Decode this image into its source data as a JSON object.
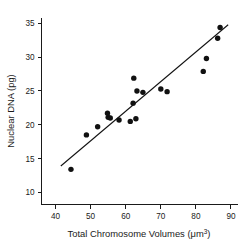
{
  "chart_data": {
    "type": "scatter",
    "title": "",
    "xlabel": "Total Chromosome Volumes (μm³)",
    "xlabel_base": "Total Chromosome Volumes (",
    "xlabel_mu": "μm",
    "xlabel_sup": "3",
    "xlabel_close": ")",
    "ylabel": "Nuclear DNA (pg)",
    "xlim": [
      36,
      92
    ],
    "ylim": [
      8.2,
      35.8
    ],
    "xticks": [
      40,
      50,
      60,
      70,
      80,
      90
    ],
    "xtick_labels": [
      "40",
      "50",
      "60",
      "70",
      "80",
      "90"
    ],
    "yticks": [
      10,
      15,
      20,
      25,
      30,
      35
    ],
    "ytick_labels": [
      "10",
      "15",
      "20",
      "25",
      "30",
      "35"
    ],
    "grid": false,
    "legend": "none",
    "marker": "filled-circle",
    "marker_color": "#111111",
    "points": [
      {
        "x": 44.4,
        "y": 13.4
      },
      {
        "x": 48.8,
        "y": 18.5
      },
      {
        "x": 52.0,
        "y": 19.7
      },
      {
        "x": 54.8,
        "y": 21.7
      },
      {
        "x": 55.0,
        "y": 21.1
      },
      {
        "x": 55.6,
        "y": 21.0
      },
      {
        "x": 58.1,
        "y": 20.7
      },
      {
        "x": 61.3,
        "y": 20.5
      },
      {
        "x": 62.1,
        "y": 23.2
      },
      {
        "x": 62.3,
        "y": 26.9
      },
      {
        "x": 62.9,
        "y": 20.9
      },
      {
        "x": 63.2,
        "y": 25.0
      },
      {
        "x": 64.9,
        "y": 24.8
      },
      {
        "x": 70.0,
        "y": 25.3
      },
      {
        "x": 71.8,
        "y": 24.9
      },
      {
        "x": 82.1,
        "y": 27.9
      },
      {
        "x": 83.0,
        "y": 29.8
      },
      {
        "x": 86.2,
        "y": 32.8
      },
      {
        "x": 86.9,
        "y": 34.4
      }
    ],
    "fit_line": {
      "type": "linear-regression",
      "x_start": 41.5,
      "y_start": 13.9,
      "x_end": 89.2,
      "y_end": 34.8
    }
  }
}
